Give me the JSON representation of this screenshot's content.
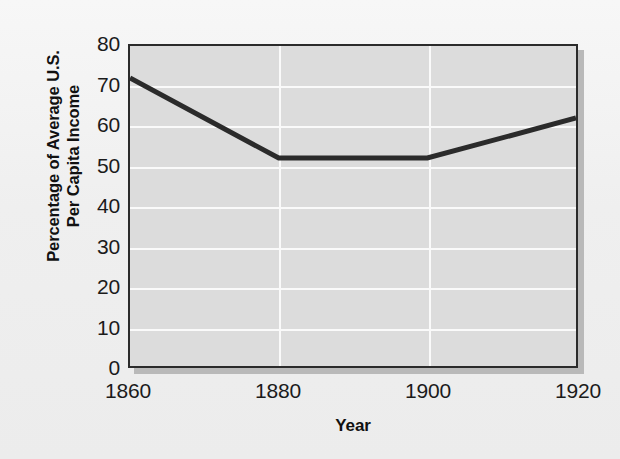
{
  "chart_data": {
    "type": "line",
    "title": "",
    "subtitle": "",
    "xlabel": "Year",
    "ylabel": "Percentage of Average U.S.\nPer Capita Income",
    "ylabel_line1": "Percentage of Average U.S.",
    "ylabel_line2": "Per Capita Income",
    "x": [
      1860,
      1880,
      1900,
      1920
    ],
    "values": [
      72,
      52,
      52,
      62
    ],
    "series": [
      {
        "name": "Percentage of Average U.S. Per Capita Income",
        "values": [
          72,
          52,
          52,
          62
        ]
      }
    ],
    "xlim": [
      1860,
      1920
    ],
    "ylim": [
      0,
      80
    ],
    "xticks": [
      1860,
      1880,
      1900,
      1920
    ],
    "xtick_labels": [
      "1860",
      "1880",
      "1900",
      "1920"
    ],
    "yticks": [
      0,
      10,
      20,
      30,
      40,
      50,
      60,
      70,
      80
    ],
    "ytick_labels": [
      "0",
      "10",
      "20",
      "30",
      "40",
      "50",
      "60",
      "70",
      "80"
    ],
    "grid": true,
    "grid_color": "#fafafa",
    "legend": false,
    "legend_position": "none",
    "line_color": "#2b2b2b",
    "line_width": 5,
    "plot_background": "#dcdcdc",
    "figure_background": "#f0f0f0",
    "frame_color": "#2b2b2b",
    "annotations": []
  }
}
